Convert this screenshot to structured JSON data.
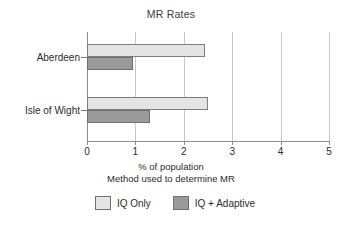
{
  "chart_data": {
    "type": "bar",
    "orientation": "horizontal",
    "title": "MR Rates",
    "xlabel": "% of population",
    "xsublabel": "Method used to determine MR",
    "ylabel": "",
    "categories": [
      "Aberdeen",
      "Isle of Wight"
    ],
    "series": [
      {
        "name": "IQ Only",
        "values": [
          2.43,
          2.5
        ],
        "color": "#e4e4e4"
      },
      {
        "name": "IQ + Adaptive",
        "values": [
          0.95,
          1.3
        ],
        "color": "#9a9a9a"
      }
    ],
    "xlim": [
      0,
      5
    ],
    "xticks": [
      0,
      1,
      2,
      3,
      4,
      5
    ],
    "xtick_labels": [
      "0",
      "1",
      "2",
      "3",
      "4",
      "5"
    ],
    "grid": "vertical",
    "legend_position": "bottom"
  },
  "legend": {
    "items": [
      {
        "label": "IQ Only",
        "swatch": "light"
      },
      {
        "label": "IQ + Adaptive",
        "swatch": "dark"
      }
    ]
  }
}
